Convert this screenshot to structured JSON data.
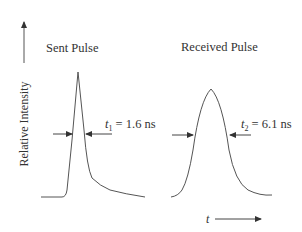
{
  "figure": {
    "y_axis_label": "Relative Intensity",
    "x_axis_label": "t",
    "sent": {
      "title": "Sent Pulse",
      "width_var": "t",
      "width_sub": "1",
      "width_value": " = 1.6 ns"
    },
    "received": {
      "title": "Received Pulse",
      "width_var": "t",
      "width_sub": "2",
      "width_value": " = 6.1 ns"
    }
  },
  "colors": {
    "line": "#444444",
    "text": "#333333",
    "background": "#ffffff"
  }
}
